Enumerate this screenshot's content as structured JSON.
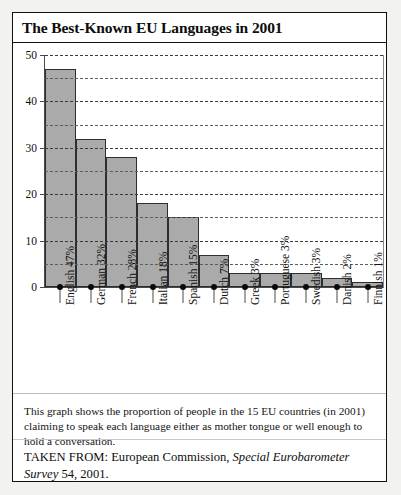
{
  "card": {
    "title": "The Best-Known EU Languages in 2001"
  },
  "chart_data": {
    "type": "bar",
    "title": "The Best-Known EU Languages in 2001",
    "xlabel": "",
    "ylabel": "",
    "ylim": [
      0,
      50
    ],
    "yticks": [
      0,
      10,
      20,
      30,
      40,
      50
    ],
    "minor_gridlines": [
      5,
      15,
      25,
      35,
      45
    ],
    "grid": true,
    "legend": null,
    "categories": [
      "English 47%",
      "German 32%",
      "French 28%",
      "Italian 18%",
      "Spanish 15%",
      "Dutch 7%",
      "Greek 3%",
      "Portuguese 3%",
      "Swedish 3%",
      "Danish 2%",
      "Finnish 1%"
    ],
    "languages": [
      "English",
      "German",
      "French",
      "Italian",
      "Spanish",
      "Dutch",
      "Greek",
      "Portuguese",
      "Swedish",
      "Danish",
      "Finnish"
    ],
    "values": [
      47,
      32,
      28,
      18,
      15,
      7,
      3,
      3,
      3,
      2,
      1
    ],
    "bar_color": "#aaaaaa",
    "bar_edge_color": "#2d2d2d"
  },
  "caption": {
    "text": "This graph shows the proportion of people in the 15 EU countries (in 2001) claiming to speak each language either as mother tongue or well enough to hold a conversation."
  },
  "source": {
    "prefix": "TAKEN FROM: European Commission,",
    "italic": "Special Eurobarometer Survey",
    "suffix": "54, 2001."
  }
}
